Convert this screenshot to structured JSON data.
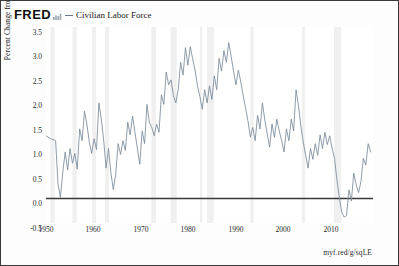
{
  "header": {
    "logo_text": "FRED",
    "spark_icon": "sparkline-icon",
    "legend": [
      {
        "label": "Civilian Labor Force",
        "color": "#6a7b8c"
      }
    ]
  },
  "source": {
    "text": "myf.red/g/sqLE"
  },
  "chart_data": {
    "type": "line",
    "title": "",
    "xlabel": "",
    "ylabel": "Percent Change from Year Ago",
    "xlim": [
      1948,
      2016
    ],
    "ylim": [
      -0.5,
      3.5
    ],
    "grid": false,
    "legend_position": "top",
    "yticks": [
      "3.5",
      "3.0",
      "2.5",
      "2.0",
      "1.5",
      "1.0",
      "0.5",
      "0.0",
      "-0.5"
    ],
    "ytick_values": [
      3.5,
      3.0,
      2.5,
      2.0,
      1.5,
      1.0,
      0.5,
      0.0,
      -0.5
    ],
    "xticks": [
      "1950",
      "1960",
      "1970",
      "1980",
      "1990",
      "2000",
      "2010"
    ],
    "xtick_values": [
      1950,
      1960,
      1970,
      1980,
      1990,
      2000,
      2010
    ],
    "zero_line": 0.0,
    "series": [
      {
        "name": "Civilian Labor Force",
        "color": "#7b8a99",
        "x": [
          1948,
          1949,
          1950,
          1950.5,
          1951,
          1951.5,
          1952,
          1952.5,
          1953,
          1953.5,
          1954,
          1954.5,
          1955,
          1955.5,
          1956,
          1956.5,
          1957,
          1957.5,
          1958,
          1958.5,
          1959,
          1959.5,
          1960,
          1960.5,
          1961,
          1961.5,
          1962,
          1962.5,
          1963,
          1963.5,
          1964,
          1964.5,
          1965,
          1965.5,
          1966,
          1966.5,
          1967,
          1967.5,
          1968,
          1968.5,
          1969,
          1969.5,
          1970,
          1970.5,
          1971,
          1971.5,
          1972,
          1972.5,
          1973,
          1973.5,
          1974,
          1974.5,
          1975,
          1975.5,
          1976,
          1976.5,
          1977,
          1977.5,
          1978,
          1978.5,
          1979,
          1979.5,
          1980,
          1980.5,
          1981,
          1981.5,
          1982,
          1982.5,
          1983,
          1983.5,
          1984,
          1984.5,
          1985,
          1985.5,
          1986,
          1986.5,
          1987,
          1987.5,
          1988,
          1988.5,
          1989,
          1989.5,
          1990,
          1990.5,
          1991,
          1991.5,
          1992,
          1992.5,
          1993,
          1993.5,
          1994,
          1994.5,
          1995,
          1995.5,
          1996,
          1996.5,
          1997,
          1997.5,
          1998,
          1998.5,
          1999,
          1999.5,
          2000,
          2000.5,
          2001,
          2001.5,
          2002,
          2002.5,
          2003,
          2003.5,
          2004,
          2004.5,
          2005,
          2005.5,
          2006,
          2006.5,
          2007,
          2007.5,
          2008,
          2008.5,
          2009,
          2009.5,
          2010,
          2010.5,
          2011,
          2011.5,
          2012,
          2012.5,
          2013,
          2013.5,
          2014,
          2014.5,
          2015,
          2015.5
        ],
        "y": [
          1.28,
          1.22,
          1.18,
          0.3,
          0.02,
          0.55,
          0.95,
          0.58,
          1.02,
          0.72,
          0.92,
          0.6,
          1.42,
          1.18,
          1.78,
          1.52,
          1.15,
          0.92,
          1.22,
          1.0,
          1.95,
          1.62,
          1.18,
          0.62,
          1.02,
          0.52,
          0.18,
          0.5,
          1.12,
          0.9,
          1.18,
          0.98,
          1.56,
          1.3,
          1.68,
          1.35,
          1.02,
          0.7,
          1.38,
          1.12,
          1.92,
          1.55,
          1.45,
          1.28,
          1.52,
          1.35,
          2.12,
          1.92,
          2.58,
          2.32,
          2.42,
          2.1,
          1.95,
          2.22,
          2.78,
          2.52,
          3.08,
          2.72,
          3.1,
          2.85,
          2.62,
          2.3,
          2.08,
          1.82,
          2.22,
          1.95,
          2.3,
          2.02,
          2.5,
          2.22,
          2.86,
          2.6,
          3.02,
          2.78,
          3.18,
          2.9,
          2.6,
          2.32,
          2.62,
          2.38,
          2.1,
          1.85,
          1.58,
          1.25,
          1.45,
          1.18,
          1.7,
          1.42,
          1.95,
          1.6,
          1.32,
          1.05,
          1.52,
          1.25,
          1.62,
          1.38,
          1.18,
          0.95,
          1.42,
          1.18,
          1.62,
          1.38,
          2.22,
          1.9,
          1.48,
          1.15,
          0.88,
          0.62,
          1.02,
          0.8,
          1.12,
          0.88,
          1.3,
          1.02,
          1.35,
          1.1,
          1.28,
          1.02,
          0.82,
          0.38,
          0.02,
          -0.28,
          -0.38,
          -0.35,
          0.18,
          -0.05,
          0.52,
          0.28,
          0.12,
          0.35,
          0.82,
          0.68,
          1.12,
          0.95
        ]
      }
    ],
    "recession_bands": [
      [
        1948.9,
        1949.8
      ],
      [
        1953.5,
        1954.4
      ],
      [
        1957.6,
        1958.4
      ],
      [
        1960.3,
        1961.1
      ],
      [
        1969.9,
        1970.9
      ],
      [
        1973.9,
        1975.2
      ],
      [
        1980.0,
        1980.5
      ],
      [
        1981.5,
        1982.9
      ],
      [
        1990.5,
        1991.2
      ],
      [
        2001.2,
        2001.9
      ],
      [
        2007.9,
        2009.4
      ]
    ],
    "recession_color": "#f0f0f0"
  }
}
